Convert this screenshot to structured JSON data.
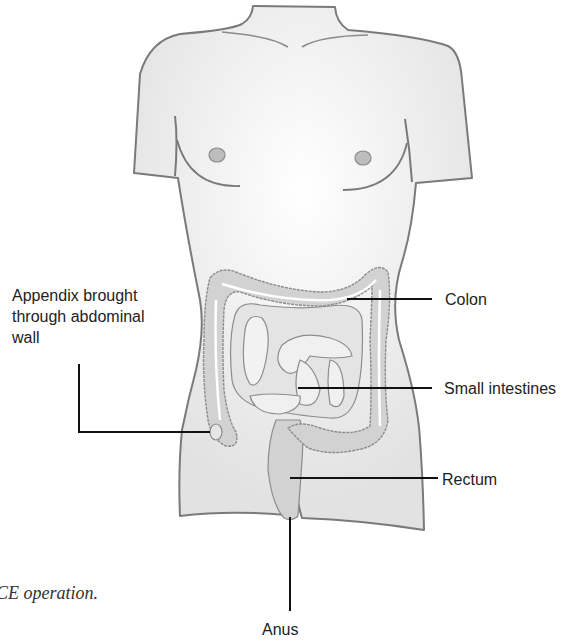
{
  "diagram": {
    "labels": {
      "appendix": [
        "Appendix brought",
        "through abdominal",
        "wall"
      ],
      "colon": "Colon",
      "small_intestines": "Small intestines",
      "rectum": "Rectum",
      "anus": "Anus"
    },
    "caption": "CE operation."
  },
  "colors": {
    "body_fill": "#ececec",
    "body_outline": "#7a7a7a",
    "organ_fill": "#d2d2d2",
    "organ_outline": "#8c8c8c",
    "nipple_fill": "#bdbdbd",
    "leader_line": "#111111",
    "text": "#222222"
  }
}
